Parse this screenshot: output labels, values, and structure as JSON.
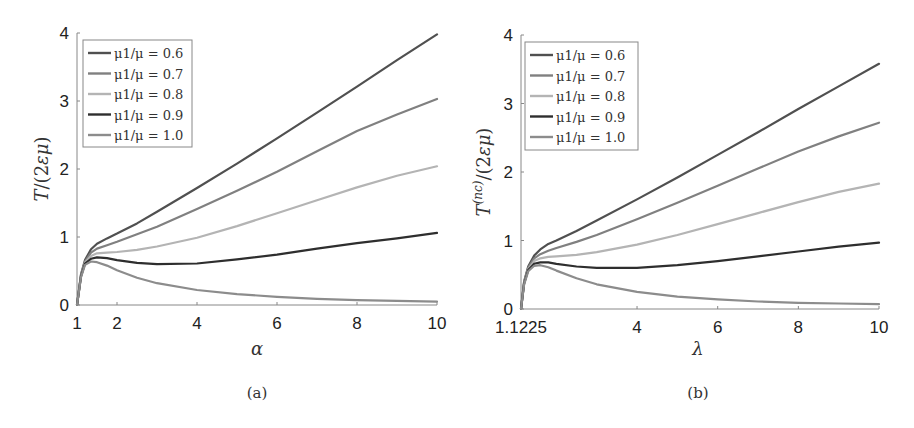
{
  "chart_data": [
    {
      "type": "line",
      "panel": "a",
      "caption": "(a)",
      "xlabel": "α",
      "ylabel": "T/(2εμ)",
      "xlim": [
        1,
        10
      ],
      "ylim": [
        0,
        4
      ],
      "xticks": [
        1,
        2,
        4,
        6,
        8,
        10
      ],
      "xtick_labels": [
        "1",
        "2",
        "4",
        "6",
        "8",
        "10"
      ],
      "yticks": [
        0,
        1,
        2,
        3,
        4
      ],
      "ytick_labels": [
        "0",
        "1",
        "2",
        "3",
        "4"
      ],
      "grid": false,
      "legend_position": "upper left",
      "x": [
        1.0,
        1.1,
        1.2,
        1.35,
        1.5,
        1.75,
        2.0,
        2.5,
        3.0,
        4.0,
        5.0,
        6.0,
        7.0,
        8.0,
        9.0,
        10.0
      ],
      "series": [
        {
          "name": "μ1/μ = 0.6",
          "color": "#505050",
          "values": [
            0.0,
            0.45,
            0.66,
            0.82,
            0.9,
            0.98,
            1.05,
            1.2,
            1.37,
            1.72,
            2.08,
            2.45,
            2.83,
            3.21,
            3.6,
            3.98
          ]
        },
        {
          "name": "μ1/μ = 0.7",
          "color": "#808080",
          "values": [
            0.0,
            0.44,
            0.64,
            0.77,
            0.83,
            0.88,
            0.93,
            1.04,
            1.15,
            1.41,
            1.68,
            1.96,
            2.26,
            2.56,
            2.8,
            3.03
          ]
        },
        {
          "name": "μ1/μ = 0.8",
          "color": "#b4b4b4",
          "values": [
            0.0,
            0.43,
            0.62,
            0.72,
            0.76,
            0.77,
            0.78,
            0.81,
            0.86,
            0.99,
            1.16,
            1.35,
            1.54,
            1.73,
            1.9,
            2.04
          ]
        },
        {
          "name": "μ1/μ = 0.9",
          "color": "#2e2e2e",
          "values": [
            0.0,
            0.42,
            0.61,
            0.68,
            0.7,
            0.69,
            0.66,
            0.62,
            0.6,
            0.61,
            0.67,
            0.74,
            0.83,
            0.91,
            0.98,
            1.06
          ]
        },
        {
          "name": "μ1/μ = 1.0",
          "color": "#8c8c8c",
          "values": [
            0.0,
            0.41,
            0.59,
            0.64,
            0.63,
            0.58,
            0.51,
            0.4,
            0.32,
            0.22,
            0.16,
            0.12,
            0.09,
            0.07,
            0.06,
            0.05
          ]
        }
      ]
    },
    {
      "type": "line",
      "panel": "b",
      "caption": "(b)",
      "xlabel": "λ",
      "ylabel": "T^(nc)/(2εμ)",
      "xlim": [
        1.1225,
        10
      ],
      "ylim": [
        0,
        4
      ],
      "xticks": [
        1.1225,
        4,
        6,
        8,
        10
      ],
      "xtick_labels": [
        "1.1225",
        "4",
        "6",
        "8",
        "10"
      ],
      "yticks": [
        0,
        1,
        2,
        3,
        4
      ],
      "ytick_labels": [
        "0",
        "1",
        "2",
        "3",
        "4"
      ],
      "grid": false,
      "legend_position": "upper left",
      "x": [
        1.1225,
        1.2,
        1.3,
        1.45,
        1.6,
        1.8,
        2.0,
        2.5,
        3.0,
        4.0,
        5.0,
        6.0,
        7.0,
        8.0,
        9.0,
        10.0
      ],
      "series": [
        {
          "name": "μ1/μ = 0.6",
          "color": "#505050",
          "values": [
            0.0,
            0.4,
            0.62,
            0.78,
            0.87,
            0.95,
            1.0,
            1.14,
            1.29,
            1.6,
            1.92,
            2.25,
            2.58,
            2.92,
            3.25,
            3.58
          ]
        },
        {
          "name": "μ1/μ = 0.7",
          "color": "#808080",
          "values": [
            0.0,
            0.39,
            0.6,
            0.74,
            0.8,
            0.85,
            0.89,
            0.98,
            1.08,
            1.31,
            1.55,
            1.8,
            2.05,
            2.3,
            2.52,
            2.72
          ]
        },
        {
          "name": "μ1/μ = 0.8",
          "color": "#b4b4b4",
          "values": [
            0.0,
            0.38,
            0.58,
            0.7,
            0.74,
            0.76,
            0.77,
            0.79,
            0.83,
            0.94,
            1.08,
            1.24,
            1.4,
            1.56,
            1.71,
            1.83
          ]
        },
        {
          "name": "μ1/μ = 0.9",
          "color": "#2e2e2e",
          "values": [
            0.0,
            0.37,
            0.57,
            0.66,
            0.68,
            0.68,
            0.66,
            0.62,
            0.6,
            0.6,
            0.64,
            0.7,
            0.77,
            0.84,
            0.91,
            0.97
          ]
        },
        {
          "name": "μ1/μ = 1.0",
          "color": "#8c8c8c",
          "values": [
            0.0,
            0.36,
            0.55,
            0.63,
            0.64,
            0.61,
            0.56,
            0.45,
            0.36,
            0.25,
            0.18,
            0.14,
            0.11,
            0.09,
            0.08,
            0.07
          ]
        }
      ]
    }
  ],
  "legend_labels": [
    "μ1/μ = 0.6",
    "μ1/μ = 0.7",
    "μ1/μ = 0.8",
    "μ1/μ = 0.9",
    "μ1/μ = 1.0"
  ]
}
